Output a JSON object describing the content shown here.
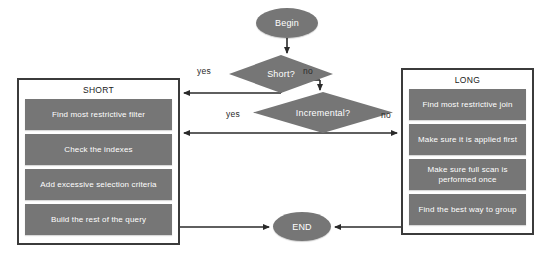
{
  "diagram": {
    "colors": {
      "node_fill": "#767676",
      "node_text": "#ffffff",
      "container_border": "#3b3b3b",
      "background": "#ffffff",
      "edge": "#2a2a2a"
    },
    "start": {
      "label": "Begin"
    },
    "end": {
      "label": "END"
    },
    "decisions": [
      {
        "id": "short",
        "label": "Short?",
        "yes_label": "yes",
        "no_label": "no"
      },
      {
        "id": "incremental",
        "label": "Incremental?",
        "yes_label": "yes",
        "no_label": "no"
      }
    ],
    "branches": [
      {
        "id": "short",
        "title": "SHORT",
        "steps": [
          "Find most restrictive filter",
          "Check the indexes",
          "Add excessive selection criteria",
          "Build the rest of the query"
        ]
      },
      {
        "id": "long",
        "title": "LONG",
        "steps": [
          "Find most restrictive join",
          "Make sure it is applied first",
          "Make sure full scan is performed once",
          "Find the best way to group"
        ]
      }
    ]
  }
}
